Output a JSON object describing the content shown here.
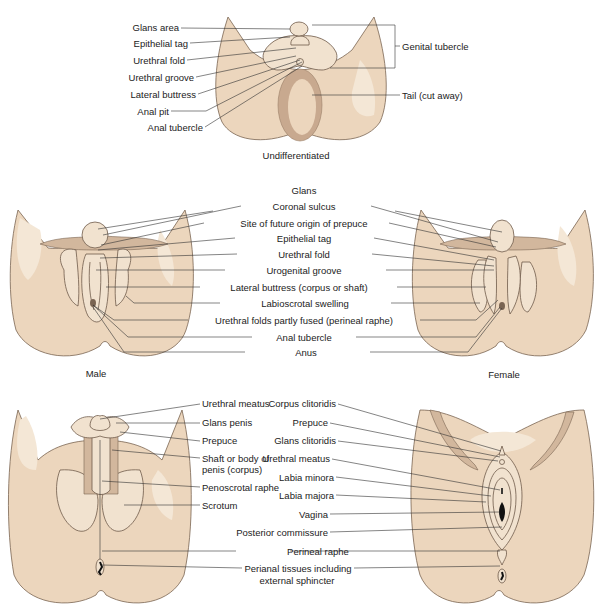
{
  "colors": {
    "skin": "#ecd6bd",
    "skin_light": "#f3e6d4",
    "skin_shadow": "#c9ad94",
    "outline": "#6e5a4a",
    "line": "#333333"
  },
  "panels": {
    "undifferentiated": {
      "caption": "Undifferentiated",
      "left_labels": [
        "Glans area",
        "Epithelial tag",
        "Urethral fold",
        "Urethral groove",
        "Lateral buttress",
        "Anal pit",
        "Anal tubercle"
      ],
      "right_labels": [
        "Genital tubercle",
        "Tail (cut away)"
      ]
    },
    "middle": {
      "left_caption": "Male",
      "right_caption": "Female",
      "center_labels": [
        "Glans",
        "Coronal sulcus",
        "Site of future origin of prepuce",
        "Epithelial tag",
        "Urethral fold",
        "Urogenital groove",
        "Lateral buttress (corpus or shaft)",
        "Labioscrotal swelling",
        "Urethral folds partly fused (perineal raphe)",
        "Anal tubercle",
        "Anus"
      ]
    },
    "male_adult": {
      "labels": [
        "Urethral meatus",
        "Glans penis",
        "Prepuce",
        "Shaft or body of",
        "penis (corpus)",
        "Penoscrotal raphe",
        "Scrotum"
      ]
    },
    "female_adult": {
      "labels": [
        "Corpus clitoridis",
        "Prepuce",
        "Glans clitoridis",
        "Urethral meatus",
        "Labia minora",
        "Labia majora",
        "Vagina",
        "Posterior commissure"
      ]
    },
    "shared_bottom": {
      "labels": [
        "Perineal raphe",
        "Perianal tissues including",
        "external sphincter"
      ]
    }
  }
}
